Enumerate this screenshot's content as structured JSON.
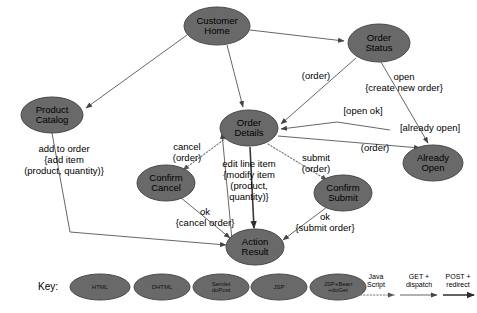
{
  "diagram": {
    "colors": {
      "node_fill": "#696969",
      "node_stroke": "#4a4a4a",
      "edge_thin": "#555555",
      "edge_thick": "#3a3a3a",
      "edge_dotted": "#777777",
      "background": "#ffffff",
      "text": "#000000"
    },
    "nodes": [
      {
        "id": "customer-home",
        "label_lines": [
          "Customer",
          "Home"
        ],
        "cx": 217,
        "cy": 26,
        "rx": 33,
        "ry": 19
      },
      {
        "id": "order-status",
        "label_lines": [
          "Order",
          "Status"
        ],
        "cx": 379,
        "cy": 43,
        "rx": 31,
        "ry": 19
      },
      {
        "id": "product-catalog",
        "label_lines": [
          "Product",
          "Catalog"
        ],
        "cx": 52,
        "cy": 115,
        "rx": 31,
        "ry": 18
      },
      {
        "id": "order-details",
        "label_lines": [
          "Order",
          "Details"
        ],
        "cx": 249,
        "cy": 128,
        "rx": 29,
        "ry": 18
      },
      {
        "id": "already-open",
        "label_lines": [
          "Already",
          "Open"
        ],
        "cx": 433,
        "cy": 163,
        "rx": 30,
        "ry": 18
      },
      {
        "id": "confirm-cancel",
        "label_lines": [
          "Confirm",
          "Cancel"
        ],
        "cx": 166,
        "cy": 183,
        "rx": 29,
        "ry": 18
      },
      {
        "id": "confirm-submit",
        "label_lines": [
          "Confirm",
          "Submit"
        ],
        "cx": 343,
        "cy": 193,
        "rx": 29,
        "ry": 18
      },
      {
        "id": "action-result",
        "label_lines": [
          "Action",
          "Result"
        ],
        "cx": 255,
        "cy": 247,
        "rx": 29,
        "ry": 18
      }
    ],
    "edge_labels": [
      {
        "id": "order-1",
        "lines": [
          "(order)"
        ],
        "x": 316,
        "y": 76
      },
      {
        "id": "open-create",
        "lines": [
          "open",
          "{create new order}"
        ],
        "x": 404,
        "y": 82
      },
      {
        "id": "open-ok",
        "lines": [
          "[open ok]"
        ],
        "x": 363,
        "y": 111
      },
      {
        "id": "already-open",
        "lines": [
          "[already open]"
        ],
        "x": 430,
        "y": 128
      },
      {
        "id": "order-2",
        "lines": [
          "(order)"
        ],
        "x": 375,
        "y": 148
      },
      {
        "id": "add-to-order",
        "lines": [
          "add to order",
          "{add item",
          "(product, quantity)}"
        ],
        "x": 64,
        "y": 160
      },
      {
        "id": "cancel-order",
        "lines": [
          "cancel",
          "(order)"
        ],
        "x": 187,
        "y": 152
      },
      {
        "id": "edit-line-item",
        "lines": [
          "edit line item",
          "{modify item",
          "(product,",
          "quantity)}"
        ],
        "x": 249,
        "y": 180
      },
      {
        "id": "submit-order",
        "lines": [
          "submit",
          "(order)"
        ],
        "x": 316,
        "y": 163
      },
      {
        "id": "ok-cancel",
        "lines": [
          "ok",
          "{cancel order}"
        ],
        "x": 205,
        "y": 217
      },
      {
        "id": "ok-submit",
        "lines": [
          "ok",
          "{submit order}"
        ],
        "x": 325,
        "y": 222
      }
    ],
    "legend": {
      "key_label": "Key:",
      "key_x": 48,
      "key_y": 287,
      "nodes": [
        {
          "id": "legend-html",
          "lines": [
            "HTML"
          ],
          "cx": 100,
          "cy": 287,
          "rx": 30,
          "ry": 13
        },
        {
          "id": "legend-dhtml",
          "lines": [
            "DHTML"
          ],
          "cx": 162,
          "cy": 287,
          "rx": 28,
          "ry": 13
        },
        {
          "id": "legend-servlet",
          "lines": [
            "Servlet",
            "doPost"
          ],
          "cx": 221,
          "cy": 287,
          "rx": 28,
          "ry": 13
        },
        {
          "id": "legend-jsp",
          "lines": [
            "JSP"
          ],
          "cx": 279,
          "cy": 287,
          "rx": 28,
          "ry": 13
        },
        {
          "id": "legend-jspbean",
          "lines": [
            "JSP+Bean",
            "+doGet"
          ],
          "cx": 338,
          "cy": 287,
          "rx": 28,
          "ry": 13
        }
      ],
      "arrows": [
        {
          "id": "legend-javascript",
          "lines": [
            "Java",
            "Script"
          ],
          "style": "dotted",
          "x1": 357,
          "x2": 394,
          "y": 295,
          "label_x": 376,
          "label_y": 281
        },
        {
          "id": "legend-get",
          "lines": [
            "GET +",
            "dispatch"
          ],
          "style": "thin",
          "x1": 400,
          "x2": 437,
          "y": 295,
          "label_x": 419,
          "label_y": 281
        },
        {
          "id": "legend-post",
          "lines": [
            "POST +",
            "redirect"
          ],
          "style": "thick",
          "x1": 443,
          "x2": 474,
          "y": 295,
          "label_x": 458,
          "label_y": 281
        }
      ]
    }
  }
}
